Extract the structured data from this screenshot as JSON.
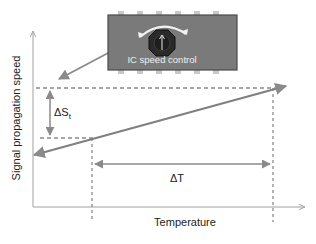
{
  "diagram": {
    "y_axis_label": "Signal propagation speed",
    "x_axis_label": "Temperature",
    "delta_s_label": "ΔS",
    "delta_s_subscript": "t",
    "delta_t_label": "ΔT",
    "chip_label": "IC speed control",
    "colors": {
      "axis": "#9a9a9a",
      "line": "#7f7f7f",
      "dashed": "#8a8a8a",
      "chip_body": "#7a7a7a",
      "chip_border": "#4a4a4a",
      "chip_pin": "#c8c8c8",
      "knob": "#2a2a2a",
      "chip_text": "#f0f0f0"
    }
  }
}
